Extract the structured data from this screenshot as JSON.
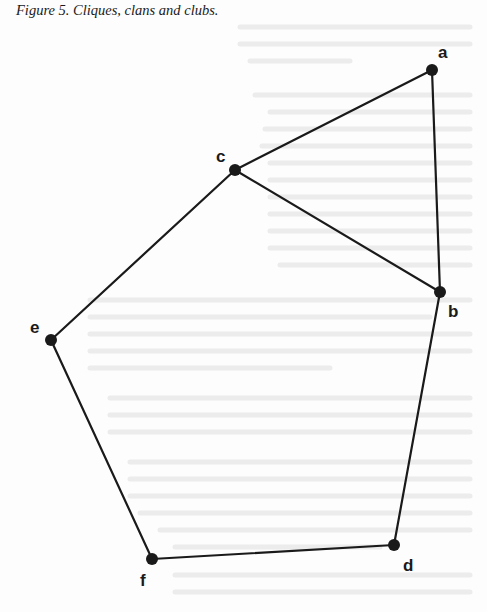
{
  "figure": {
    "caption": "Figure 5. Cliques, clans and clubs.",
    "colors": {
      "edge": "#1a1a1a",
      "node": "#1a1a1a",
      "background": "#fdfdfd",
      "bleed_through": "#e6e6e6"
    },
    "nodes": [
      {
        "id": "a",
        "label": "a",
        "x": 432,
        "y": 70,
        "lx": 438,
        "ly": 58
      },
      {
        "id": "b",
        "label": "b",
        "x": 440,
        "y": 292,
        "lx": 448,
        "ly": 317
      },
      {
        "id": "c",
        "label": "c",
        "x": 235,
        "y": 170,
        "lx": 216,
        "ly": 162
      },
      {
        "id": "d",
        "label": "d",
        "x": 394,
        "y": 545,
        "lx": 403,
        "ly": 571
      },
      {
        "id": "e",
        "label": "e",
        "x": 51,
        "y": 340,
        "lx": 30,
        "ly": 333
      },
      {
        "id": "f",
        "label": "f",
        "x": 152,
        "y": 559,
        "lx": 140,
        "ly": 586
      }
    ],
    "edges": [
      [
        "a",
        "c"
      ],
      [
        "a",
        "b"
      ],
      [
        "c",
        "b"
      ],
      [
        "c",
        "e"
      ],
      [
        "e",
        "f"
      ],
      [
        "f",
        "d"
      ],
      [
        "d",
        "b"
      ]
    ]
  }
}
